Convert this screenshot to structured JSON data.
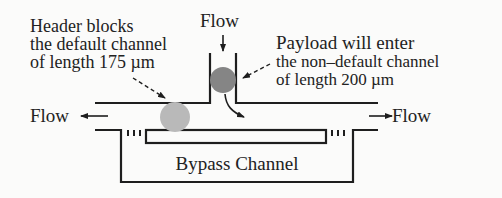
{
  "diagram": {
    "type": "microfluidic-channel-schematic",
    "labels": {
      "flow_top": "Flow",
      "flow_left": "Flow",
      "flow_right": "Flow",
      "header_note": [
        "Header blocks",
        "the default channel",
        "of length 175 µm"
      ],
      "payload_note": [
        "Payload will enter",
        "the non–default channel",
        "of length 200 µm"
      ],
      "bypass": "Bypass Channel"
    },
    "elements": {
      "header_droplet": {
        "color": "#b9b9b9",
        "cx": 175,
        "cy": 117,
        "r": 15
      },
      "payload_droplet": {
        "color": "#858585",
        "cx": 223,
        "cy": 80,
        "r": 13
      }
    },
    "colors": {
      "line": "#1e1e1e",
      "text": "#222222",
      "background": "#fbfbfa"
    }
  }
}
